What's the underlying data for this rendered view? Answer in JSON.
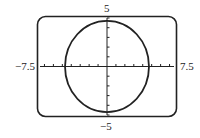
{
  "chart_data": {
    "type": "line",
    "title": "",
    "xlim": [
      -7.5,
      7.5
    ],
    "ylim": [
      -5,
      5
    ],
    "x_tick_step": 1,
    "y_tick_step": 1,
    "grid": false,
    "series": [
      {
        "name": "circle",
        "shape": "circle",
        "center": [
          0,
          0
        ],
        "radius": 4.7
      }
    ],
    "labels": {
      "xmin": "−7.5",
      "xmax": "7.5",
      "ymax": "5",
      "ymin": "−5"
    }
  },
  "colors": {
    "stroke": "#222222",
    "background": "#ffffff"
  }
}
